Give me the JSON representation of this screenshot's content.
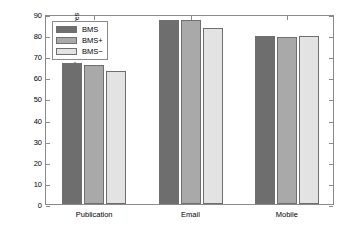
{
  "chart_data": {
    "type": "bar",
    "title": "",
    "xlabel": "",
    "ylabel": "Average F1−score of learning curves",
    "categories": [
      "Publication",
      "Email",
      "Mobile"
    ],
    "ylim": [
      0,
      90
    ],
    "yticks": [
      0,
      10,
      20,
      30,
      40,
      50,
      60,
      70,
      80,
      90
    ],
    "ytick_labels": [
      "0",
      "10",
      "20",
      "30",
      "40",
      "50",
      "60",
      "70",
      "80",
      "90"
    ],
    "grid": false,
    "legend_position": "upper left",
    "series": [
      {
        "name": "BMS",
        "color": "#6e6e6e",
        "values": [
          66.6,
          87.2,
          79.8
        ]
      },
      {
        "name": "BMS+",
        "color": "#a9a9a9",
        "values": [
          66.0,
          87.2,
          79.2
        ]
      },
      {
        "name": "BMS−",
        "color": "#e3e3e3",
        "values": [
          63.2,
          83.2,
          79.5
        ]
      }
    ]
  },
  "legend": {
    "items": [
      {
        "label": "BMS"
      },
      {
        "label": "BMS+"
      },
      {
        "label": "BMS−"
      }
    ]
  }
}
